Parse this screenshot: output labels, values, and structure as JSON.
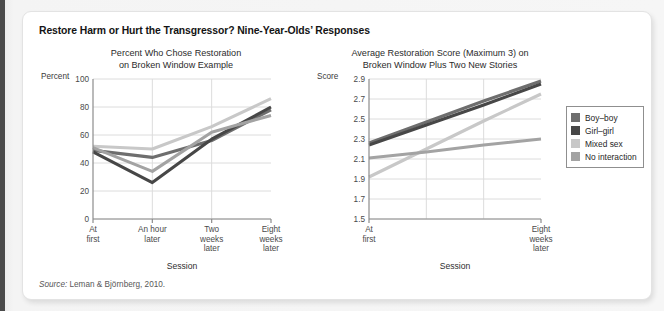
{
  "title": "Restore Harm or Hurt the Transgressor? Nine-Year-Olds’ Responses",
  "source": {
    "label": "Source:",
    "text": "Leman & Björnberg, 2010."
  },
  "legend": {
    "position": "right",
    "items": [
      {
        "label": "Boy–boy",
        "color": "#6e6e6e"
      },
      {
        "label": "Girl–girl",
        "color": "#474747"
      },
      {
        "label": "Mixed sex",
        "color": "#c8c8c8"
      },
      {
        "label": "No interaction",
        "color": "#a3a3a3"
      }
    ]
  },
  "chart_data": [
    {
      "type": "line",
      "id": "left",
      "title": "Percent Who Chose Restoration\non Broken Window Example",
      "title_line1": "Percent Who Chose Restoration",
      "title_line2": "on Broken Window Example",
      "xlabel": "Session",
      "ylabel": "Percent",
      "ylim": [
        0,
        100
      ],
      "yticks": [
        100,
        80,
        60,
        40,
        20,
        0
      ],
      "grid": true,
      "categories": [
        "At first",
        "An hour later",
        "Two weeks later",
        "Eight weeks later"
      ],
      "category_lines": [
        [
          "At",
          "first"
        ],
        [
          "An hour",
          "later"
        ],
        [
          "Two",
          "weeks",
          "later"
        ],
        [
          "Eight",
          "weeks",
          "later"
        ]
      ],
      "series": [
        {
          "name": "Boy–boy",
          "color": "#6e6e6e",
          "values": [
            49,
            44,
            56,
            78
          ]
        },
        {
          "name": "Girl–girl",
          "color": "#474747",
          "values": [
            48,
            26,
            57,
            80
          ]
        },
        {
          "name": "Mixed sex",
          "color": "#c8c8c8",
          "values": [
            52,
            50,
            66,
            86
          ]
        },
        {
          "name": "No interaction",
          "color": "#a3a3a3",
          "values": [
            51,
            34,
            62,
            74
          ]
        }
      ]
    },
    {
      "type": "line",
      "id": "right",
      "title": "Average Restoration Score (Maximum 3) on\nBroken Window Plus Two New Stories",
      "title_line1": "Average Restoration Score (Maximum 3) on",
      "title_line2": "Broken Window Plus Two New Stories",
      "xlabel": "Session",
      "ylabel": "Score",
      "ylim": [
        1.5,
        2.9
      ],
      "yticks": [
        "2.9",
        "2.7",
        "2.5",
        "2.3",
        "2.1",
        "1.9",
        "1.7",
        "1.5"
      ],
      "grid": true,
      "categories": [
        "At first",
        "",
        "",
        "Eight weeks later"
      ],
      "category_lines": [
        [
          "At",
          "first"
        ],
        [
          "Eight",
          "weeks",
          "later"
        ]
      ],
      "series": [
        {
          "name": "Boy–boy",
          "color": "#6e6e6e",
          "values": [
            2.26,
            2.47,
            2.68,
            2.88
          ]
        },
        {
          "name": "Girl–girl",
          "color": "#474747",
          "values": [
            2.24,
            2.44,
            2.64,
            2.85
          ]
        },
        {
          "name": "Mixed sex",
          "color": "#c8c8c8",
          "values": [
            1.92,
            2.2,
            2.48,
            2.75
          ]
        },
        {
          "name": "No interaction",
          "color": "#a3a3a3",
          "values": [
            2.11,
            2.17,
            2.24,
            2.3
          ]
        }
      ]
    }
  ]
}
